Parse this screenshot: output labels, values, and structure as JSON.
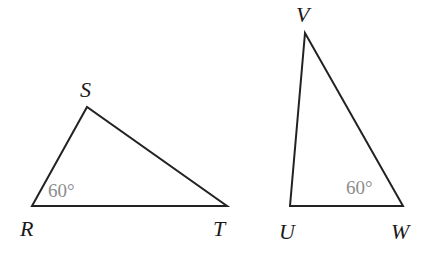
{
  "diagram": {
    "triangles": [
      {
        "name": "RST",
        "vertices": [
          {
            "label": "R",
            "x": 32,
            "y": 206,
            "lx": 20,
            "ly": 236
          },
          {
            "label": "S",
            "x": 87,
            "y": 107,
            "lx": 78,
            "ly": 95
          },
          {
            "label": "T",
            "x": 227,
            "y": 206,
            "lx": 214,
            "ly": 236
          }
        ],
        "angle_label": {
          "text": "60°",
          "vertex": "R",
          "x": 52,
          "y": 195
        }
      },
      {
        "name": "UVW",
        "vertices": [
          {
            "label": "V",
            "x": 305,
            "y": 33,
            "lx": 295,
            "ly": 22
          },
          {
            "label": "U",
            "x": 290,
            "y": 206,
            "lx": 278,
            "ly": 240
          },
          {
            "label": "W",
            "x": 403,
            "y": 206,
            "lx": 392,
            "ly": 240
          }
        ],
        "angle_label": {
          "text": "60°",
          "vertex": "W",
          "x": 345,
          "y": 192
        }
      }
    ]
  },
  "labels": {
    "R": "R",
    "S": "S",
    "T": "T",
    "U": "U",
    "V": "V",
    "W": "W",
    "angle_R": "60°",
    "angle_W": "60°"
  }
}
